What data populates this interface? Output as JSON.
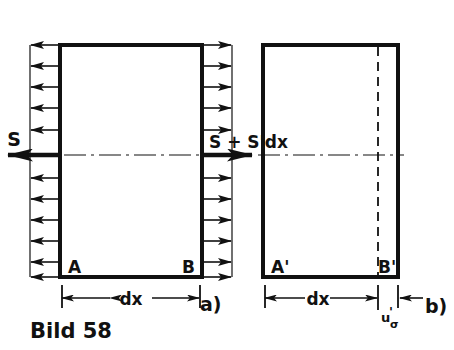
{
  "figure": {
    "caption": "Bild 58",
    "background_color": "#ffffff",
    "ink_color": "#111111",
    "panels": [
      {
        "id": "a",
        "tag": "a)",
        "corner_left_label": "A",
        "corner_right_label": "B",
        "dimension_label": "dx",
        "load_left_label": "S",
        "load_right_label": "S + S'dx",
        "distributed_arrow_count": 11,
        "left_arrow_direction": "left",
        "right_arrow_direction": "right"
      },
      {
        "id": "b",
        "tag": "b)",
        "corner_left_label": "A'",
        "corner_right_label": "B'",
        "dimension_label": "dx",
        "gap_label_main": "u",
        "gap_label_prime": "'",
        "gap_label_subscript": "σ",
        "has_dashed_line": true
      }
    ]
  },
  "icons": {
    "arrow_head": "triangle-arrowhead",
    "centerline": "dash-dot-centerline",
    "dimension_tick": "dimension-tick"
  }
}
